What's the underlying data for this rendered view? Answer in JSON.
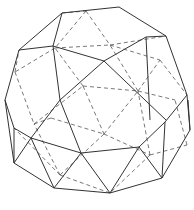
{
  "figure": {
    "stroke_color": "#333333",
    "hidden_color": "#555555",
    "visible_edges": [
      [
        62,
        13,
        119,
        7
      ],
      [
        119,
        7,
        166,
        36
      ],
      [
        166,
        36,
        146,
        37
      ],
      [
        62,
        13,
        53,
        46
      ],
      [
        62,
        13,
        19,
        50
      ],
      [
        19,
        50,
        53,
        46
      ],
      [
        53,
        46,
        104,
        61
      ],
      [
        104,
        61,
        146,
        37
      ],
      [
        53,
        46,
        60,
        100
      ],
      [
        146,
        37,
        150,
        120
      ],
      [
        166,
        36,
        187,
        95
      ],
      [
        19,
        50,
        5,
        100
      ],
      [
        104,
        61,
        166,
        120
      ],
      [
        104,
        61,
        60,
        100
      ],
      [
        60,
        100,
        31,
        138
      ],
      [
        5,
        100,
        14,
        128
      ],
      [
        14,
        128,
        31,
        138
      ],
      [
        14,
        128,
        14,
        163
      ],
      [
        31,
        138,
        14,
        163
      ],
      [
        31,
        138,
        54,
        188
      ],
      [
        31,
        138,
        81,
        153
      ],
      [
        81,
        153,
        54,
        188
      ],
      [
        81,
        153,
        110,
        193
      ],
      [
        81,
        153,
        139,
        147
      ],
      [
        139,
        147,
        110,
        193
      ],
      [
        139,
        147,
        162,
        178
      ],
      [
        139,
        147,
        165,
        122
      ],
      [
        165,
        122,
        187,
        95
      ],
      [
        165,
        122,
        162,
        178
      ],
      [
        187,
        95,
        190,
        130
      ],
      [
        190,
        130,
        162,
        178
      ],
      [
        190,
        130,
        188,
        100
      ],
      [
        14,
        163,
        54,
        188
      ],
      [
        54,
        188,
        110,
        193
      ],
      [
        110,
        193,
        162,
        178
      ],
      [
        5,
        100,
        14,
        163
      ],
      [
        60,
        100,
        81,
        153
      ]
    ],
    "hidden_edges": [
      [
        62,
        13,
        86,
        11
      ],
      [
        86,
        11,
        55,
        48
      ],
      [
        86,
        11,
        110,
        45
      ],
      [
        55,
        48,
        110,
        45
      ],
      [
        110,
        45,
        166,
        36
      ],
      [
        110,
        45,
        160,
        60
      ],
      [
        160,
        60,
        187,
        95
      ],
      [
        55,
        48,
        15,
        72
      ],
      [
        15,
        72,
        19,
        50
      ],
      [
        15,
        72,
        34,
        124
      ],
      [
        34,
        124,
        83,
        86
      ],
      [
        83,
        86,
        55,
        48
      ],
      [
        83,
        86,
        138,
        91
      ],
      [
        138,
        91,
        110,
        45
      ],
      [
        138,
        91,
        160,
        60
      ],
      [
        138,
        91,
        175,
        100
      ],
      [
        83,
        86,
        104,
        134
      ],
      [
        104,
        134,
        138,
        91
      ],
      [
        34,
        124,
        51,
        118
      ],
      [
        51,
        118,
        104,
        134
      ],
      [
        104,
        134,
        60,
        175
      ],
      [
        60,
        175,
        34,
        124
      ],
      [
        104,
        134,
        150,
        155
      ],
      [
        150,
        155,
        138,
        91
      ],
      [
        150,
        155,
        187,
        145
      ],
      [
        60,
        175,
        110,
        193
      ],
      [
        60,
        175,
        14,
        128
      ],
      [
        150,
        155,
        110,
        193
      ],
      [
        187,
        145,
        175,
        100
      ]
    ]
  }
}
